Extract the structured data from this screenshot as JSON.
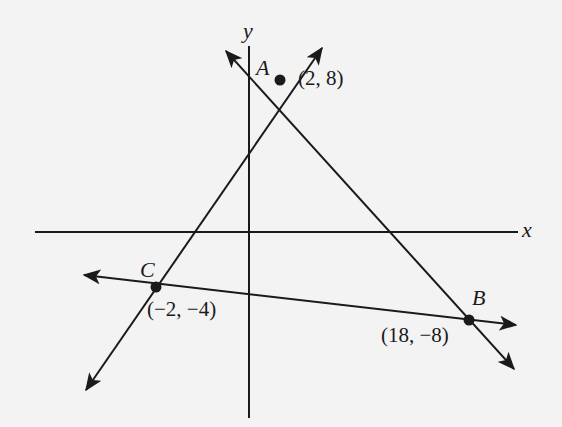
{
  "diagram": {
    "type": "coordinate-plane-triangle",
    "background": "#f3f3f3",
    "stroke_color": "#1a1a1a",
    "axes": {
      "x_label": "x",
      "y_label": "y"
    },
    "points": [
      {
        "name": "A",
        "coord_label": "(2, 8)",
        "x": 2,
        "y": 8
      },
      {
        "name": "B",
        "coord_label": "(18, −8)",
        "x": 18,
        "y": -8
      },
      {
        "name": "C",
        "coord_label": "(−2, −4)",
        "x": -2,
        "y": -4
      }
    ],
    "lines": [
      {
        "through": [
          "A",
          "C"
        ],
        "arrows": "both"
      },
      {
        "through": [
          "A",
          "B"
        ],
        "arrows": "both"
      },
      {
        "through": [
          "C",
          "B"
        ],
        "arrows": "both"
      }
    ]
  }
}
